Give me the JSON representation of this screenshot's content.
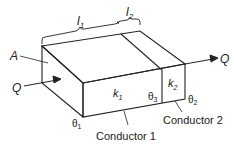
{
  "diagram": {
    "labels": {
      "l1": "l",
      "l1_sub": "1",
      "l2": "l",
      "l2_sub": "2",
      "area": "A",
      "q_in": "Q",
      "q_out": "Q",
      "k1": "k",
      "k1_sub": "1",
      "k2": "k",
      "k2_sub": "2",
      "theta1": "θ",
      "theta1_sub": "1",
      "theta2": "θ",
      "theta2_sub": "2",
      "theta3": "θ",
      "theta3_sub": "3",
      "conductor1": "Conductor 1",
      "conductor2": "Conductor 2"
    },
    "colors": {
      "line": "#222222",
      "background": "#ffffff"
    }
  }
}
